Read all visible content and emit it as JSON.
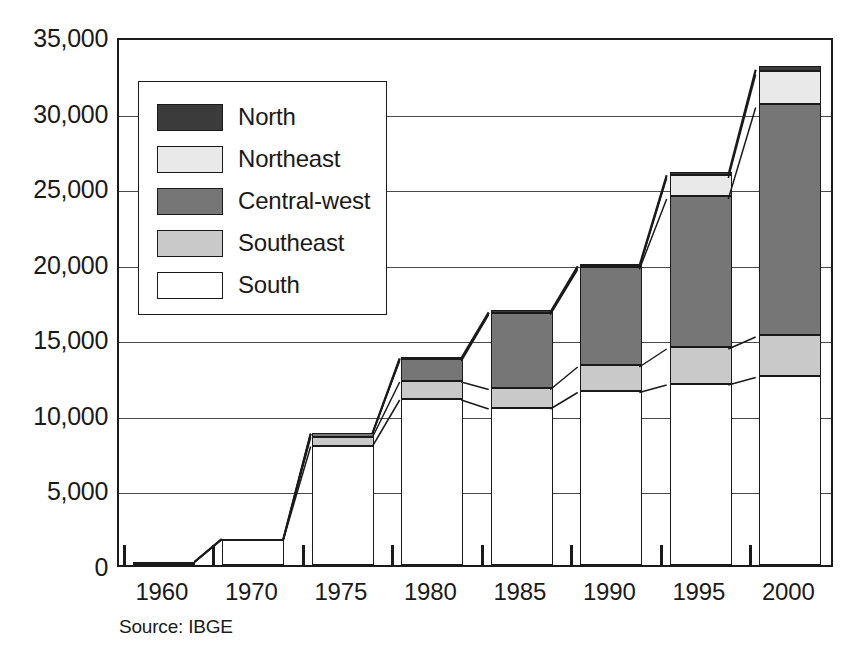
{
  "chart_data": {
    "type": "bar",
    "subtype": "stacked-bar-with-connectors",
    "title": "",
    "subtitle": "",
    "xlabel": "",
    "ylabel": "",
    "source": "Source: IBGE",
    "grid": true,
    "legend_position": "inside-top-left",
    "ylim": [
      0,
      35000
    ],
    "ytick_labels": [
      "0",
      "5,000",
      "10,000",
      "15,000",
      "20,000",
      "25,000",
      "30,000",
      "35,000"
    ],
    "ytick_values": [
      0,
      5000,
      10000,
      15000,
      20000,
      25000,
      30000,
      35000
    ],
    "categories": [
      "1960",
      "1970",
      "1975",
      "1980",
      "1985",
      "1990",
      "1995",
      "2000"
    ],
    "series": [
      {
        "name": "South",
        "color": "#ffffff",
        "values": [
          180,
          1700,
          7900,
          11000,
          10400,
          11500,
          12000,
          12500
        ]
      },
      {
        "name": "Southeast",
        "color": "#c9c9c9",
        "values": [
          20,
          20,
          600,
          1200,
          1300,
          1700,
          2400,
          2700
        ]
      },
      {
        "name": "Central-west",
        "color": "#767676",
        "values": [
          0,
          0,
          250,
          1400,
          5000,
          6500,
          10000,
          15300
        ]
      },
      {
        "name": "Northeast",
        "color": "#e9e9e9",
        "values": [
          0,
          0,
          0,
          120,
          80,
          90,
          1400,
          2200
        ]
      },
      {
        "name": "North",
        "color": "#3b3b3b",
        "values": [
          0,
          0,
          0,
          60,
          60,
          130,
          180,
          320
        ]
      }
    ],
    "totals": [
      200,
      1720,
      8750,
      13780,
      16840,
      19920,
      25980,
      33020
    ]
  },
  "legend": {
    "items": [
      {
        "label": "North",
        "color": "#3b3b3b"
      },
      {
        "label": "Northeast",
        "color": "#e9e9e9"
      },
      {
        "label": "Central-west",
        "color": "#767676"
      },
      {
        "label": "Southeast",
        "color": "#c9c9c9"
      },
      {
        "label": "South",
        "color": "#ffffff"
      }
    ]
  },
  "axis": {
    "y_labels": [
      "35,000",
      "30,000",
      "25,000",
      "20,000",
      "15,000",
      "10,000",
      "5,000",
      "0"
    ],
    "x_labels": [
      "1960",
      "1970",
      "1975",
      "1980",
      "1985",
      "1990",
      "1995",
      "2000"
    ]
  },
  "footer": {
    "source": "Source: IBGE"
  }
}
